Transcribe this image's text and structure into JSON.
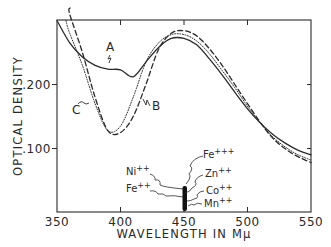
{
  "chart_data": {
    "type": "line",
    "title": "",
    "xlabel": "WAVELENGTH IN Mμ",
    "ylabel": "OPTICAL DENSITY",
    "xlim": [
      350,
      550
    ],
    "ylim": [
      0.0587,
      0.303
    ],
    "x_ticks": [
      350,
      400,
      450,
      500,
      550
    ],
    "x_tick_labels": [
      "350",
      "400",
      "450",
      "500",
      "550"
    ],
    "y_ticks": [
      0.1,
      0.2
    ],
    "y_tick_labels": [
      ".100",
      ".200"
    ],
    "grid": false,
    "x": [
      350,
      360,
      370,
      380,
      390,
      400,
      410,
      420,
      430,
      440,
      450,
      460,
      470,
      480,
      490,
      500,
      510,
      520,
      530,
      540,
      550
    ],
    "series": [
      {
        "name": "A",
        "style": "solid",
        "values": [
          0.3,
          0.265,
          0.243,
          0.23,
          0.224,
          0.223,
          0.212,
          0.235,
          0.258,
          0.272,
          0.272,
          0.262,
          0.24,
          0.215,
          0.188,
          0.162,
          0.14,
          0.122,
          0.108,
          0.097,
          0.09
        ]
      },
      {
        "name": "B",
        "style": "dotted",
        "values": [
          null,
          0.28,
          0.23,
          0.17,
          0.128,
          0.135,
          0.18,
          0.235,
          0.265,
          0.278,
          0.278,
          0.268,
          0.248,
          0.222,
          0.195,
          0.166,
          0.14,
          0.118,
          0.102,
          0.09,
          0.082
        ]
      },
      {
        "name": "C",
        "style": "dashed",
        "values": [
          null,
          0.31,
          0.25,
          0.18,
          0.128,
          0.125,
          0.15,
          0.2,
          0.255,
          0.28,
          0.284,
          0.276,
          0.256,
          0.23,
          0.2,
          0.17,
          0.141,
          0.116,
          0.099,
          0.087,
          0.078
        ]
      }
    ],
    "series_labels": [
      {
        "name": "A",
        "text": "A",
        "approx_x": 395,
        "approx_y": 0.245
      },
      {
        "name": "B",
        "text": "B",
        "approx_x": 431,
        "approx_y": 0.183
      },
      {
        "name": "C",
        "text": "C",
        "approx_x": 367,
        "approx_y": 0.18
      }
    ],
    "annotations": {
      "marker": {
        "description": "vertical black bar near 450 mμ indicating absorption maxima of metal ions",
        "x": 450,
        "y_range": [
          0.062,
          0.1
        ]
      },
      "ions": [
        {
          "text": "Fe",
          "charge": "+++",
          "side": "right"
        },
        {
          "text": "Ni",
          "charge": "++",
          "side": "left"
        },
        {
          "text": "Zn",
          "charge": "++",
          "side": "right"
        },
        {
          "text": "Fe",
          "charge": "++",
          "side": "left"
        },
        {
          "text": "Co",
          "charge": "++",
          "side": "right"
        },
        {
          "text": "Mn",
          "charge": "++",
          "side": "right"
        }
      ]
    },
    "colors": {
      "ink": "#2a2a2a",
      "background": "#ffffff"
    }
  }
}
